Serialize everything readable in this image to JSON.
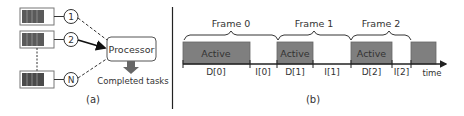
{
  "panel_a": {
    "caption": "(a)",
    "queues": [
      {
        "id": "1",
        "label": "1",
        "connection": "dashed"
      },
      {
        "id": "2",
        "label": "2",
        "connection": "solid-arrow"
      },
      {
        "id": "N",
        "label": "N",
        "connection": "dashed"
      }
    ],
    "processor_label": "Processor",
    "output_label": "Completed tasks"
  },
  "panel_b": {
    "caption": "(b)",
    "frames": [
      {
        "label": "Frame 0",
        "active_label": "Active",
        "d_label": "D[0]",
        "i_label": "I[0]"
      },
      {
        "label": "Frame 1",
        "active_label": "Active",
        "d_label": "D[1]",
        "i_label": "I[1]"
      },
      {
        "label": "Frame 2",
        "active_label": "Active",
        "d_label": "D[2]",
        "i_label": "I[2]"
      }
    ],
    "axis_label": "time"
  },
  "colors": {
    "active_fill": "#7f7f7f",
    "queue_fill": "#5a5a5a",
    "line": "#222222",
    "text": "#333333"
  }
}
